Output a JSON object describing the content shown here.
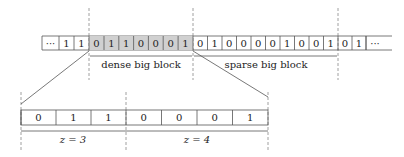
{
  "top_row": {
    "y": 36,
    "h": 14,
    "cells": [
      {
        "x": 42,
        "w": 17,
        "label": "···",
        "shaded": false
      },
      {
        "x": 59,
        "w": 15,
        "label": "1",
        "shaded": false
      },
      {
        "x": 74,
        "w": 15,
        "label": "1",
        "shaded": false
      },
      {
        "x": 89,
        "w": 15,
        "label": "0",
        "shaded": true
      },
      {
        "x": 104,
        "w": 14.8,
        "label": "1",
        "shaded": true
      },
      {
        "x": 118.8,
        "w": 14.8,
        "label": "1",
        "shaded": true
      },
      {
        "x": 133.6,
        "w": 14.8,
        "label": "0",
        "shaded": true
      },
      {
        "x": 148.4,
        "w": 14.8,
        "label": "0",
        "shaded": true
      },
      {
        "x": 163.2,
        "w": 14.9,
        "label": "0",
        "shaded": true
      },
      {
        "x": 178.1,
        "w": 14.9,
        "label": "1",
        "shaded": true
      },
      {
        "x": 193,
        "w": 14.5,
        "label": "0",
        "shaded": false
      },
      {
        "x": 207.5,
        "w": 14.5,
        "label": "1",
        "shaded": false
      },
      {
        "x": 222,
        "w": 14.5,
        "label": "0",
        "shaded": false
      },
      {
        "x": 236.5,
        "w": 14.5,
        "label": "0",
        "shaded": false
      },
      {
        "x": 251,
        "w": 14.5,
        "label": "0",
        "shaded": false
      },
      {
        "x": 265.5,
        "w": 14.5,
        "label": "0",
        "shaded": false
      },
      {
        "x": 280,
        "w": 14.5,
        "label": "1",
        "shaded": false
      },
      {
        "x": 294.5,
        "w": 14.5,
        "label": "0",
        "shaded": false
      },
      {
        "x": 309,
        "w": 14.5,
        "label": "0",
        "shaded": false
      },
      {
        "x": 323.5,
        "w": 14.5,
        "label": "1",
        "shaded": false
      },
      {
        "x": 338,
        "w": 14,
        "label": "0",
        "shaded": false
      },
      {
        "x": 352,
        "w": 14,
        "label": "1",
        "shaded": false
      },
      {
        "x": 366,
        "w": 22,
        "label": "···",
        "shaded": false,
        "open": true
      }
    ]
  },
  "bottom_row": {
    "y": 110,
    "h": 15,
    "cells": [
      {
        "x": 21,
        "w": 35,
        "label": "0"
      },
      {
        "x": 56,
        "w": 35,
        "label": "1"
      },
      {
        "x": 91,
        "w": 35,
        "label": "1"
      },
      {
        "x": 126,
        "w": 35.5,
        "label": "0"
      },
      {
        "x": 161.5,
        "w": 35.5,
        "label": "0"
      },
      {
        "x": 197,
        "w": 35.5,
        "label": "0"
      },
      {
        "x": 232.5,
        "w": 35.5,
        "label": "1"
      }
    ]
  },
  "labels": {
    "dense": "dense big block",
    "sparse": "sparse big block",
    "z3": "z = 3",
    "z4": "z = 4"
  },
  "colors": {
    "shade": "#d0d0d0",
    "line": "#555555",
    "dash": "#888888"
  }
}
